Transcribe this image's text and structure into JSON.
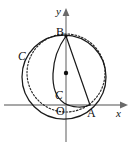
{
  "figure": {
    "background_color": "#ffffff",
    "ink_color": "#1a1a1a",
    "axis_color": "#8a8a8a",
    "width": 137,
    "height": 146
  },
  "axes": {
    "x_label": "x",
    "y_label": "y",
    "origin_label": "O",
    "x_axis_y_px": 105,
    "y_axis_x_px": 66
  },
  "points": [
    {
      "name": "B",
      "label": "B",
      "x": 66,
      "y": 36,
      "on": "y-axis"
    },
    {
      "name": "A",
      "label": "A",
      "x": 90,
      "y": 105,
      "on": "x-axis"
    },
    {
      "name": "O",
      "label": "O",
      "x": 66,
      "y": 105,
      "on": "origin"
    },
    {
      "name": "center",
      "label": "",
      "x": 66,
      "y": 73,
      "on": "y-axis"
    }
  ],
  "curves": [
    {
      "name": "large-circle",
      "label": "C",
      "style": "solid",
      "center_x": 64,
      "center_y": 77,
      "radius": 42,
      "label_x": 20,
      "label_y": 57
    },
    {
      "name": "dashed-circle",
      "label": "",
      "style": "dashed",
      "center_x": 66,
      "center_y": 73,
      "radius": 39,
      "label_x": 0,
      "label_y": 0
    },
    {
      "name": "inner-arc",
      "label": "C",
      "style": "solid",
      "label_x": 56,
      "label_y": 90
    }
  ],
  "segments": [
    {
      "name": "chord-BA",
      "from": "B",
      "to": "A"
    }
  ],
  "labels": {
    "point_a": "A",
    "point_b": "B",
    "origin": "O",
    "axis_x": "x",
    "axis_y": "y",
    "curve_outer": "C",
    "curve_inner": "C"
  }
}
